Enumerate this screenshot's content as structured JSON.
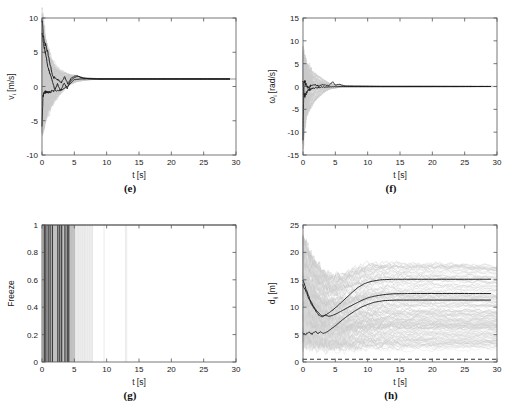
{
  "figure": {
    "background": "#ffffff",
    "accent_dark": "#1a1a1a",
    "accent_gray": "#c9c9c9",
    "panel_count": 4
  },
  "panels": [
    {
      "id": "e",
      "caption": "(e)",
      "xlabel": "t [s]",
      "ylabel_main": "v",
      "ylabel_sub": "i",
      "ylabel_unit": " [m/s]",
      "ylabel_full": "v_i [m/s]",
      "xticks": [
        "0",
        "5",
        "10",
        "15",
        "20",
        "25",
        "30"
      ],
      "yticks": [
        "10",
        "5",
        "0",
        "-5",
        "-10"
      ]
    },
    {
      "id": "f",
      "caption": "(f)",
      "xlabel": "t [s]",
      "ylabel_main": "ω",
      "ylabel_sub": "i",
      "ylabel_unit": " [rad/s]",
      "ylabel_full": "ω_i [rad/s]",
      "xticks": [
        "0",
        "5",
        "10",
        "15",
        "20",
        "25",
        "30"
      ],
      "yticks": [
        "15",
        "10",
        "5",
        "0",
        "-5",
        "-10",
        "-15"
      ]
    },
    {
      "id": "g",
      "caption": "(g)",
      "xlabel": "t [s]",
      "ylabel_main": "Freeze",
      "ylabel_sub": "",
      "ylabel_unit": "",
      "ylabel_full": "Freeze",
      "xticks": [
        "0",
        "5",
        "10",
        "15",
        "20",
        "25",
        "30"
      ],
      "yticks": [
        "1",
        "0.8",
        "0.6",
        "0.4",
        "0.2",
        "0"
      ]
    },
    {
      "id": "h",
      "caption": "(h)",
      "xlabel": "t [s]",
      "ylabel_main": "d",
      "ylabel_sub": "ij",
      "ylabel_unit": " [m]",
      "ylabel_full": "d_ij [m]",
      "xticks": [
        "0",
        "5",
        "10",
        "15",
        "20",
        "25",
        "30"
      ],
      "yticks": [
        "25",
        "20",
        "15",
        "10",
        "5",
        "0"
      ]
    }
  ],
  "chart_data": [
    {
      "type": "line",
      "panel": "e",
      "title": "(e)",
      "xlabel": "t [s]",
      "ylabel": "v_i [m/s]",
      "xlim": [
        0,
        30
      ],
      "ylim": [
        -10,
        10
      ],
      "xticks": [
        0,
        5,
        10,
        15,
        20,
        25,
        30
      ],
      "yticks": [
        -10,
        -5,
        0,
        5,
        10
      ],
      "grid": false,
      "legend": "none",
      "note": "Ensemble of agent linear velocities; light gray cloud of many runs, several dark representative trajectories converging to ~1 m/s after ~7 s",
      "series": [
        {
          "name": "dark-trajectory-1",
          "color": "#1a1a1a",
          "x": [
            0,
            0.2,
            0.5,
            0.9,
            1.3,
            1.7,
            2.1,
            2.5,
            3.0,
            3.5,
            4.0,
            4.5,
            5.0,
            5.4,
            6.0,
            7.0,
            9.0,
            12.0,
            16.0,
            20.0,
            25.0,
            29.0
          ],
          "y": [
            9.9,
            7.6,
            6.2,
            5.0,
            3.0,
            1.4,
            1.2,
            1.0,
            0.6,
            1.4,
            0.4,
            1.2,
            1.5,
            1.6,
            1.3,
            1.15,
            1.1,
            1.1,
            1.1,
            1.1,
            1.1,
            1.1
          ]
        },
        {
          "name": "dark-trajectory-2",
          "color": "#1a1a1a",
          "x": [
            0,
            0.3,
            0.7,
            1.1,
            1.6,
            2.0,
            2.4,
            2.9,
            3.4,
            3.9,
            4.4,
            5.0,
            5.6,
            6.5,
            8.0,
            11.0,
            15.0,
            20.0,
            25.0,
            29.0
          ],
          "y": [
            7.8,
            6.0,
            4.0,
            2.2,
            0.9,
            -0.6,
            0.4,
            -0.7,
            0.5,
            -0.3,
            0.8,
            1.3,
            1.5,
            1.2,
            1.1,
            1.1,
            1.1,
            1.1,
            1.1,
            1.1
          ]
        },
        {
          "name": "dark-trajectory-3",
          "color": "#1a1a1a",
          "x": [
            0,
            0.15,
            0.4,
            0.8,
            1.2,
            1.8,
            2.5,
            3.2,
            4.0,
            5.0,
            6.0,
            8.0,
            12.0,
            18.0,
            24.0,
            29.0
          ],
          "y": [
            -6.1,
            -1.2,
            -0.9,
            -0.8,
            -0.75,
            -0.7,
            -0.6,
            -0.4,
            0.1,
            1.0,
            1.1,
            1.1,
            1.1,
            1.1,
            1.1,
            1.1
          ]
        }
      ],
      "cloud_envelope": {
        "upper": [
          10,
          7,
          5,
          3.5,
          2.8,
          2.4,
          2.2,
          2.0,
          1.8,
          1.5,
          1.3,
          1.2,
          1.15,
          1.1,
          1.1
        ],
        "lower": [
          -6.5,
          -4.5,
          -3.5,
          -2.5,
          -1.8,
          -1.2,
          -0.6,
          -0.2,
          0.3,
          0.7,
          0.9,
          1.0,
          1.05,
          1.1,
          1.1
        ],
        "x": [
          0,
          0.5,
          1,
          1.5,
          2,
          2.5,
          3,
          3.5,
          4,
          5,
          6,
          7,
          8,
          10,
          30
        ]
      }
    },
    {
      "type": "line",
      "panel": "f",
      "title": "(f)",
      "xlabel": "t [s]",
      "ylabel": "ω_i [rad/s]",
      "xlim": [
        0,
        30
      ],
      "ylim": [
        -15,
        15
      ],
      "xticks": [
        0,
        5,
        10,
        15,
        20,
        25,
        30
      ],
      "yticks": [
        -15,
        -10,
        -5,
        0,
        5,
        10,
        15
      ],
      "grid": false,
      "legend": "none",
      "note": "Angular velocities; large transient spike at t=0 from about -12 to +7 rad/s, rapidly damping to 0 rad/s by ~7 s",
      "series": [
        {
          "name": "dark-trajectory-1",
          "color": "#1a1a1a",
          "x": [
            0,
            0.05,
            0.15,
            0.3,
            0.5,
            0.8,
            1.2,
            1.8,
            2.5,
            3.2,
            4.0,
            4.6,
            5.0,
            5.6,
            6.5,
            8.0,
            12.0,
            18.0,
            24.0,
            29.0
          ],
          "y": [
            -12.0,
            -6.0,
            0.8,
            1.0,
            0.3,
            -0.4,
            0.2,
            0.5,
            0.1,
            0.4,
            0.2,
            1.0,
            0.3,
            0.5,
            0.1,
            0.05,
            0.0,
            0.0,
            0.0,
            0.0
          ]
        },
        {
          "name": "dark-trajectory-2",
          "color": "#1a1a1a",
          "x": [
            0,
            0.1,
            0.25,
            0.45,
            0.7,
            1.0,
            1.5,
            2.2,
            3.0,
            4.0,
            5.0,
            6.0,
            8.0,
            12.0,
            20.0,
            29.0
          ],
          "y": [
            1.2,
            -1.5,
            -2.2,
            -1.6,
            -1.0,
            -0.6,
            -0.4,
            -0.25,
            -0.15,
            -0.1,
            -0.05,
            0.0,
            0.0,
            0.0,
            0.0,
            0.0
          ]
        }
      ],
      "cloud_envelope": {
        "upper": [
          7,
          5,
          4,
          3,
          2.5,
          2,
          1.5,
          1,
          0.6,
          0.3,
          0.1,
          0
        ],
        "lower": [
          -12,
          -6,
          -4.5,
          -3.5,
          -2.8,
          -2,
          -1.4,
          -0.9,
          -0.5,
          -0.25,
          -0.1,
          0
        ],
        "x": [
          0,
          0.5,
          1,
          1.5,
          2,
          2.5,
          3,
          3.5,
          4,
          5,
          6,
          30
        ]
      }
    },
    {
      "type": "line",
      "panel": "g",
      "title": "(g)",
      "xlabel": "t [s]",
      "ylabel": "Freeze",
      "xlim": [
        0,
        30
      ],
      "ylim": [
        0,
        1
      ],
      "xticks": [
        0,
        5,
        10,
        15,
        20,
        25,
        30
      ],
      "yticks": [
        0,
        0.2,
        0.4,
        0.6,
        0.8,
        1
      ],
      "grid": false,
      "legend": "none",
      "note": "Binary freeze indicator; dense vertical bands (value 1) clustered between t=0 and t=5 s, sparse faint events up to ~13 s, flat at 1 across the top axis",
      "freeze_events_dark": [
        0.35,
        0.6,
        0.95,
        1.25,
        1.6,
        2.45,
        2.75,
        3.05,
        3.55,
        3.9,
        4.15
      ],
      "freeze_events_gray": [
        0.2,
        0.45,
        0.75,
        1.1,
        1.4,
        1.8,
        2.0,
        2.2,
        2.6,
        2.9,
        3.2,
        3.4,
        3.7,
        4.05,
        4.35,
        4.6,
        4.8,
        5.0
      ],
      "freeze_events_faint": [
        5.2,
        5.45,
        5.7,
        6.0,
        6.3,
        6.6,
        7.0,
        7.4,
        7.8,
        9.6,
        12.9,
        13.1
      ]
    },
    {
      "type": "line",
      "panel": "h",
      "title": "(h)",
      "xlabel": "t [s]",
      "ylabel": "d_ij [m]",
      "xlim": [
        0,
        30
      ],
      "ylim": [
        0,
        25
      ],
      "xticks": [
        0,
        5,
        10,
        15,
        20,
        25,
        30
      ],
      "yticks": [
        0,
        5,
        10,
        15,
        20,
        25
      ],
      "grid": false,
      "legend": "none",
      "note": "Inter-agent distances; wide gray cloud dipping near t=3 s then spreading, three dark representative pairs settling at about 15.1, 12.5 and 11.3 m; dashed safety threshold line at about 0.5 m",
      "threshold_line": {
        "y": 0.5,
        "style": "dashed",
        "color": "#333333"
      },
      "series": [
        {
          "name": "dark-pair-1",
          "color": "#1a1a1a",
          "x": [
            0,
            0.5,
            1.0,
            1.6,
            2.2,
            2.8,
            3.2,
            3.8,
            4.5,
            5.5,
            6.5,
            7.5,
            8.5,
            9.5,
            10.5,
            12.0,
            14.0,
            16.0,
            20.0,
            25.0,
            29.0
          ],
          "y": [
            15.0,
            13.2,
            11.6,
            10.2,
            9.2,
            8.5,
            8.4,
            8.8,
            9.4,
            10.4,
            11.5,
            12.6,
            13.6,
            14.3,
            14.7,
            15.0,
            15.1,
            15.1,
            15.1,
            15.1,
            15.1
          ]
        },
        {
          "name": "dark-pair-2",
          "color": "#1a1a1a",
          "x": [
            0,
            0.6,
            1.2,
            1.8,
            2.4,
            3.0,
            3.4,
            4.0,
            4.8,
            5.8,
            7.0,
            8.0,
            9.0,
            10.0,
            11.0,
            12.5,
            14.0,
            17.0,
            21.0,
            25.0,
            29.0
          ],
          "y": [
            14.0,
            12.4,
            10.8,
            9.6,
            8.6,
            8.2,
            8.6,
            8.3,
            8.6,
            9.2,
            10.0,
            10.6,
            11.2,
            11.7,
            12.0,
            12.3,
            12.45,
            12.5,
            12.5,
            12.5,
            12.5
          ]
        },
        {
          "name": "dark-pair-3",
          "color": "#1a1a1a",
          "x": [
            0,
            0.4,
            0.9,
            1.4,
            1.9,
            2.3,
            2.7,
            3.1,
            3.6,
            4.2,
            5.0,
            6.0,
            7.0,
            8.0,
            9.0,
            10.0,
            11.0,
            12.5,
            14.5,
            18.0,
            23.0,
            29.0
          ],
          "y": [
            5.2,
            5.0,
            5.5,
            5.1,
            5.6,
            5.2,
            5.5,
            5.2,
            5.4,
            5.9,
            6.6,
            7.6,
            8.5,
            9.3,
            10.0,
            10.5,
            10.9,
            11.2,
            11.3,
            11.3,
            11.3,
            11.3
          ]
        }
      ],
      "cloud_envelope": {
        "upper": [
          22.5,
          19.5,
          17.6,
          16.4,
          15.8,
          15.6,
          16.0,
          16.6,
          17.2,
          17.6,
          17.9,
          18.0,
          18.0,
          18.0,
          17.9,
          17.5
        ],
        "lower": [
          3.0,
          2.6,
          2.3,
          2.1,
          2.0,
          2.0,
          2.0,
          2.0,
          2.0,
          2.0,
          2.0,
          2.0,
          2.0,
          2.0,
          2.0,
          2.0
        ],
        "x": [
          0,
          1,
          2,
          3,
          4,
          5,
          6,
          7,
          8,
          9,
          10,
          12,
          15,
          20,
          25,
          30
        ]
      }
    }
  ]
}
